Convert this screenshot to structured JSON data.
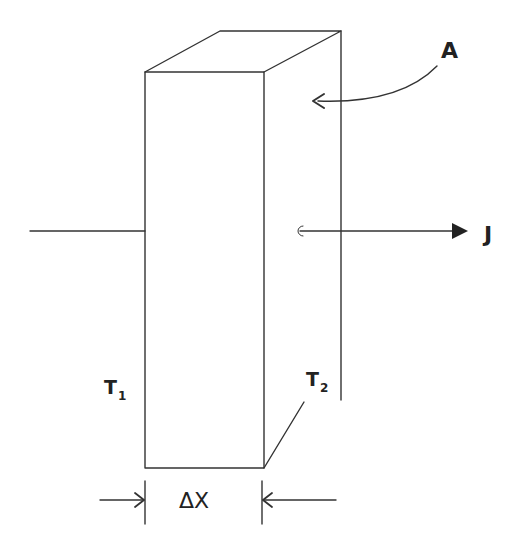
{
  "diagram": {
    "type": "slab-heat-conduction",
    "labels": {
      "area": "A",
      "flux": "J",
      "temp_left": {
        "base": "T",
        "sub": "1"
      },
      "temp_right": {
        "base": "T",
        "sub": "2"
      },
      "thickness": "ΔX"
    },
    "colors": {
      "line": "#333333",
      "background": "#ffffff"
    }
  }
}
